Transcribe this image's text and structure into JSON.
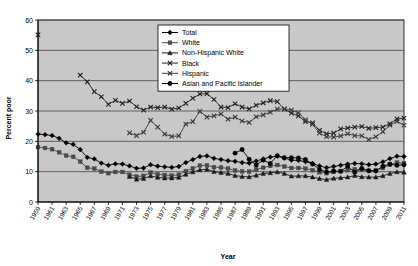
{
  "chart_data": {
    "type": "line",
    "title": "",
    "xlabel": "Year",
    "ylabel": "Percent poor",
    "ylim": [
      0,
      60
    ],
    "ytick_step": 10,
    "yticks": [
      0,
      10,
      20,
      30,
      40,
      50,
      60
    ],
    "grid": true,
    "grid_axis": "y",
    "legend_position": "top-right",
    "plot_background": "#c8c8c8",
    "x": [
      1959,
      1960,
      1961,
      1962,
      1963,
      1964,
      1965,
      1966,
      1967,
      1968,
      1969,
      1970,
      1971,
      1972,
      1973,
      1974,
      1975,
      1976,
      1977,
      1978,
      1979,
      1980,
      1981,
      1982,
      1983,
      1984,
      1985,
      1986,
      1987,
      1988,
      1989,
      1990,
      1991,
      1992,
      1993,
      1994,
      1995,
      1996,
      1997,
      1998,
      1999,
      2000,
      2001,
      2002,
      2003,
      2004,
      2005,
      2006,
      2007,
      2008,
      2009,
      2010,
      2011
    ],
    "xtick_labels": [
      "1959",
      "1961",
      "1963",
      "1965",
      "1967",
      "1969",
      "1971",
      "1973",
      "1975",
      "1977",
      "1979",
      "1981",
      "1983",
      "1985",
      "1987",
      "1989",
      "1991",
      "1993",
      "1995",
      "1997",
      "1999",
      "2001",
      "2003",
      "2005",
      "2007",
      "2009",
      "2011"
    ],
    "series": [
      {
        "name": "Total",
        "marker": "diamond",
        "color": "#000000",
        "values": [
          22.4,
          22.2,
          21.9,
          21.0,
          19.5,
          19.0,
          17.3,
          14.7,
          14.2,
          12.8,
          12.1,
          12.6,
          12.5,
          11.9,
          11.1,
          11.2,
          12.3,
          11.8,
          11.6,
          11.4,
          11.7,
          13.0,
          14.0,
          15.0,
          15.2,
          14.4,
          14.0,
          13.6,
          13.4,
          13.0,
          12.8,
          13.5,
          14.2,
          14.8,
          15.1,
          14.5,
          13.8,
          13.7,
          13.3,
          12.7,
          11.9,
          11.3,
          11.7,
          12.1,
          12.5,
          12.7,
          12.6,
          12.3,
          12.5,
          13.2,
          14.3,
          15.1,
          15.0
        ]
      },
      {
        "name": "White",
        "marker": "square",
        "color": "#4a4a4a",
        "values": [
          18.1,
          17.8,
          17.4,
          16.4,
          15.3,
          14.9,
          13.3,
          11.3,
          11.0,
          10.0,
          9.5,
          9.9,
          9.9,
          9.0,
          8.4,
          8.6,
          9.7,
          9.1,
          8.9,
          8.7,
          9.0,
          10.2,
          11.1,
          12.0,
          12.1,
          11.5,
          11.4,
          11.0,
          10.4,
          10.1,
          10.0,
          10.7,
          11.3,
          11.9,
          12.2,
          11.7,
          11.2,
          11.2,
          11.0,
          10.5,
          9.8,
          9.5,
          9.9,
          10.2,
          10.5,
          10.8,
          10.6,
          10.3,
          10.5,
          11.2,
          12.3,
          13.0,
          12.8
        ]
      },
      {
        "name": "Non-Hispanic White",
        "marker": "triangle",
        "color": "#1a1a1a",
        "values": [
          null,
          null,
          null,
          null,
          null,
          null,
          null,
          null,
          null,
          null,
          null,
          null,
          null,
          8.4,
          7.5,
          7.7,
          8.6,
          8.1,
          7.9,
          7.9,
          8.1,
          9.1,
          9.9,
          10.6,
          10.8,
          10.0,
          9.7,
          9.4,
          8.7,
          8.4,
          8.3,
          8.8,
          9.4,
          9.6,
          9.9,
          9.4,
          8.5,
          8.6,
          8.6,
          8.2,
          7.7,
          7.4,
          7.8,
          8.0,
          8.2,
          8.7,
          8.3,
          8.2,
          8.2,
          8.6,
          9.4,
          9.9,
          9.8
        ]
      },
      {
        "name": "Black",
        "marker": "cross",
        "color": "#222222",
        "values": [
          55.1,
          null,
          null,
          null,
          null,
          null,
          41.8,
          39.6,
          36.4,
          34.7,
          32.2,
          33.5,
          32.5,
          33.3,
          31.4,
          30.3,
          31.3,
          31.1,
          31.3,
          30.6,
          31.0,
          32.5,
          34.2,
          35.6,
          35.7,
          33.8,
          31.3,
          31.1,
          32.4,
          31.3,
          30.7,
          31.9,
          32.7,
          33.4,
          33.1,
          30.6,
          29.3,
          28.4,
          26.5,
          26.1,
          23.6,
          22.5,
          22.7,
          24.1,
          24.4,
          24.7,
          24.9,
          24.3,
          24.5,
          24.7,
          25.8,
          27.4,
          27.6
        ]
      },
      {
        "name": "Hispanic",
        "marker": "cross",
        "color": "#3a3a3a",
        "values": [
          null,
          null,
          null,
          null,
          null,
          null,
          null,
          null,
          null,
          null,
          null,
          null,
          null,
          22.8,
          21.9,
          23.0,
          26.9,
          24.7,
          22.4,
          21.6,
          21.8,
          25.7,
          26.5,
          29.9,
          28.0,
          28.4,
          29.0,
          27.3,
          28.0,
          26.7,
          26.2,
          28.1,
          28.7,
          29.6,
          30.6,
          30.7,
          30.3,
          29.4,
          27.1,
          25.6,
          22.7,
          21.5,
          21.4,
          21.8,
          22.5,
          21.9,
          21.8,
          20.6,
          21.5,
          23.2,
          25.3,
          26.6,
          25.3
        ]
      },
      {
        "name": "Asian and Pacific Islander",
        "marker": "circle",
        "color": "#000000",
        "values": [
          null,
          null,
          null,
          null,
          null,
          null,
          null,
          null,
          null,
          null,
          null,
          null,
          null,
          null,
          null,
          null,
          null,
          null,
          null,
          null,
          null,
          null,
          null,
          null,
          null,
          null,
          null,
          null,
          16.1,
          17.3,
          14.1,
          12.2,
          13.8,
          12.7,
          15.3,
          14.6,
          14.6,
          14.5,
          14.0,
          12.5,
          10.7,
          9.9,
          10.2,
          10.1,
          11.8,
          9.8,
          11.1,
          10.3,
          10.2,
          11.8,
          12.5,
          12.1,
          12.3
        ]
      }
    ]
  }
}
